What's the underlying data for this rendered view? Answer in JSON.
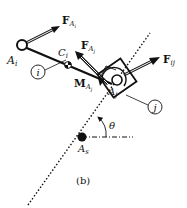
{
  "figure": {
    "caption": "(b)",
    "colors": {
      "ink": "#111111",
      "background": "#ffffff",
      "arrow_fill": "#ffffff"
    }
  },
  "points": {
    "A_i": {
      "main": "A",
      "sub": "i"
    },
    "A_j": {
      "main": "A",
      "sub": "j"
    },
    "A_s": {
      "main": "A",
      "sub": "s"
    },
    "C_i": {
      "main": "C",
      "sub": "i"
    }
  },
  "forces": {
    "F_Ai": {
      "main": "F",
      "sub1": "A",
      "sub2": "i"
    },
    "F_Aj": {
      "main": "F",
      "sub1": "A",
      "sub2": "j"
    },
    "F_ij": {
      "main": "F",
      "sub": "ij"
    }
  },
  "moments": {
    "M_Aj": {
      "main": "M",
      "sub1": "A",
      "sub2": "j"
    }
  },
  "bodies": {
    "i": {
      "label": "i"
    },
    "j": {
      "label": "j"
    }
  },
  "angle": {
    "label": "θ"
  }
}
